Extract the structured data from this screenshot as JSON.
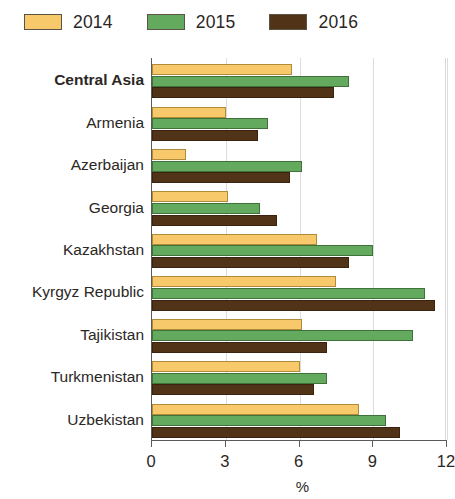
{
  "legend": {
    "entries": [
      {
        "label": "2014",
        "color": "#f8c96a",
        "swatch_name": "legend-swatch-2014"
      },
      {
        "label": "2015",
        "color": "#63a95e",
        "swatch_name": "legend-swatch-2015"
      },
      {
        "label": "2016",
        "color": "#513318",
        "swatch_name": "legend-swatch-2016"
      }
    ]
  },
  "axis": {
    "x_title": "%",
    "ticks": [
      "0",
      "3",
      "6",
      "9",
      "12"
    ]
  },
  "chart_data": {
    "type": "bar",
    "orientation": "horizontal",
    "title": "",
    "subtitle": "",
    "xlabel": "%",
    "ylabel": "",
    "xlim": [
      0,
      12
    ],
    "xticks": [
      0,
      3,
      6,
      9,
      12
    ],
    "grid": true,
    "legend_position": "top-left",
    "categories": [
      "Central Asia",
      "Armenia",
      "Azerbaijan",
      "Georgia",
      "Kazakhstan",
      "Kyrgyz Republic",
      "Tajikistan",
      "Turkmenistan",
      "Uzbekistan"
    ],
    "emphasized_categories": [
      "Central Asia"
    ],
    "series": [
      {
        "name": "2014",
        "color": "#f8c96a",
        "values": [
          5.7,
          3.0,
          1.4,
          3.1,
          6.7,
          7.5,
          6.1,
          6.0,
          8.4
        ]
      },
      {
        "name": "2015",
        "color": "#63a95e",
        "values": [
          8.0,
          4.7,
          6.1,
          4.4,
          9.0,
          11.1,
          10.6,
          7.1,
          9.5
        ]
      },
      {
        "name": "2016",
        "color": "#513318",
        "values": [
          7.4,
          4.3,
          5.6,
          5.1,
          8.0,
          11.5,
          7.1,
          6.6,
          10.1
        ]
      }
    ]
  }
}
